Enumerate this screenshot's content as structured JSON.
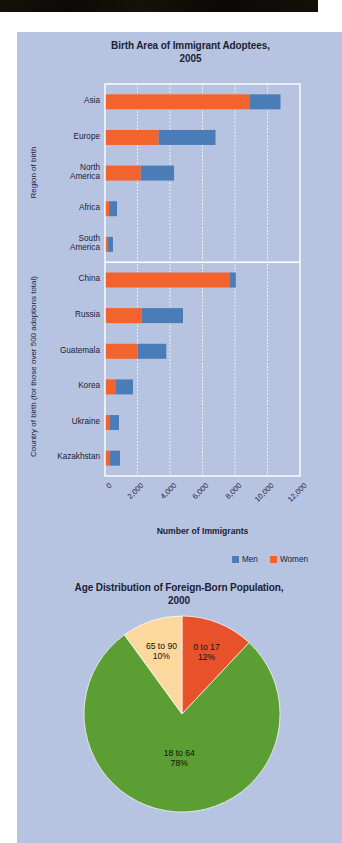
{
  "page": {
    "panel_background": "#b7c4e1",
    "margin_background": "#ffffff",
    "top_band_color": "#0e0b07",
    "text_color": "#1b2236"
  },
  "chart_data": [
    {
      "type": "bar",
      "orientation": "horizontal",
      "stacked": true,
      "title": "Birth Area of Immigrant Adoptees, 2005",
      "title_lines": [
        "Birth Area of Immigrant Adoptees,",
        "2005"
      ],
      "xlabel": "Number of Immigrants",
      "ylabel_groups": [
        "Region of birth",
        "Country of birth (for those over 500 adoptions total)"
      ],
      "categories": [
        "Asia",
        "Europe",
        "North America",
        "Africa",
        "South America",
        "China",
        "Russia",
        "Guatemala",
        "Korea",
        "Ukraine",
        "Kazakhstan"
      ],
      "category_display_lines": [
        [
          "Asia"
        ],
        [
          "Europe"
        ],
        [
          "North",
          "America"
        ],
        [
          "Africa"
        ],
        [
          "South",
          "America"
        ],
        [
          "China"
        ],
        [
          "Russia"
        ],
        [
          "Guatemala"
        ],
        [
          "Korea"
        ],
        [
          "Ukraine"
        ],
        [
          "Kazakhstan"
        ]
      ],
      "group_split_after": 5,
      "series": [
        {
          "name": "Women",
          "color": "#f2632e",
          "values": [
            8900,
            3300,
            2200,
            250,
            190,
            7650,
            2250,
            2000,
            680,
            310,
            310
          ]
        },
        {
          "name": "Men",
          "color": "#4a7cb8",
          "values": [
            1900,
            3500,
            2050,
            490,
            300,
            400,
            2550,
            1770,
            1040,
            550,
            610
          ]
        }
      ],
      "stack_order": [
        "Women",
        "Men"
      ],
      "xlim": [
        0,
        12000
      ],
      "xticks": [
        0,
        2000,
        4000,
        6000,
        8000,
        10000,
        12000
      ],
      "xticklabels": [
        "0",
        "2,000",
        "4,000",
        "6,000",
        "8,000",
        "10,000",
        "12,000"
      ],
      "grid": true,
      "grid_style": "dotted-white",
      "legend": {
        "position": "bottom-right",
        "entries": [
          {
            "label": "Men",
            "color": "#4a7cb8"
          },
          {
            "label": "Women",
            "color": "#f2632e"
          }
        ]
      }
    },
    {
      "type": "pie",
      "title": "Age Distribution of Foreign-Born Population, 2000",
      "title_lines": [
        "Age Distribution of Foreign-Born Population,",
        "2000"
      ],
      "labels": [
        "0 to 17",
        "18 to 64",
        "65 to 90"
      ],
      "values": [
        12,
        78,
        10
      ],
      "value_labels": [
        "12%",
        "78%",
        "10%"
      ],
      "colors": [
        "#e8522b",
        "#5b9e33",
        "#fbd89d"
      ],
      "start_angle": -90,
      "direction": "clockwise",
      "units": "percent"
    }
  ]
}
